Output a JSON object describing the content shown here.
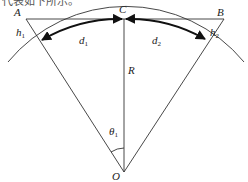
{
  "caption_fragment": "代表如下所示。",
  "diagram": {
    "points": {
      "A": {
        "label": "A",
        "x": 26,
        "y": 19
      },
      "B": {
        "label": "B",
        "x": 224,
        "y": 19
      },
      "C": {
        "label": "C",
        "x": 124,
        "y": 19
      },
      "O": {
        "label": "O",
        "x": 124,
        "y": 172
      }
    },
    "labels": {
      "h1": "h",
      "h1_sub": "1",
      "h2": "h",
      "h2_sub": "2",
      "d1": "d",
      "d1_sub": "1",
      "d2": "d",
      "d2_sub": "2",
      "R": "R",
      "theta1": "θ",
      "theta1_sub": "1"
    },
    "colors": {
      "line": "#333333",
      "arrow": "#111111"
    }
  }
}
